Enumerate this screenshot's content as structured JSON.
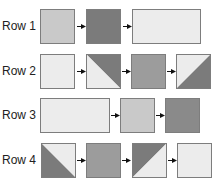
{
  "colors": {
    "light": "#ececec",
    "medium_light": "#c9c9c9",
    "medium": "#9c9c9c",
    "dark": "#7b7b7b",
    "border": "#7d7d7d",
    "arrow": "#111111"
  },
  "rows": [
    {
      "label": "Row 1",
      "blocks": [
        {
          "type": "square",
          "fill": "medium_light"
        },
        {
          "type": "square",
          "fill": "dark"
        },
        {
          "type": "rectangle",
          "fill": "light"
        }
      ]
    },
    {
      "label": "Row 2",
      "blocks": [
        {
          "type": "square",
          "fill": "light"
        },
        {
          "type": "half-square-triangle",
          "orientation": "tl-br",
          "upper_right": "dark",
          "lower_left": "light"
        },
        {
          "type": "square",
          "fill": "medium"
        },
        {
          "type": "half-square-triangle",
          "orientation": "bl-tr",
          "upper_left": "light",
          "lower_right": "dark"
        }
      ]
    },
    {
      "label": "Row 3",
      "blocks": [
        {
          "type": "rectangle",
          "fill": "light"
        },
        {
          "type": "square",
          "fill": "medium_light"
        },
        {
          "type": "square",
          "fill": "dark"
        }
      ]
    },
    {
      "label": "Row 4",
      "blocks": [
        {
          "type": "half-square-triangle",
          "orientation": "tl-br",
          "upper_right": "light",
          "lower_left": "dark"
        },
        {
          "type": "square",
          "fill": "medium"
        },
        {
          "type": "half-square-triangle",
          "orientation": "bl-tr",
          "upper_left": "dark",
          "lower_right": "light"
        },
        {
          "type": "square",
          "fill": "light"
        }
      ]
    }
  ]
}
